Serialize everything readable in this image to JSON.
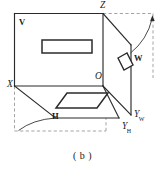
{
  "figure": {
    "caption": "( b )",
    "colors": {
      "stroke": "#2b2b2b",
      "dashed": "#8c8c8c",
      "background": "#ffffff",
      "text": "#1a1a1a"
    },
    "labels": {
      "v_plane": "V",
      "h_plane": "H",
      "w_plane": "W",
      "origin": "O",
      "axis_x": "X",
      "axis_z": "Z",
      "axis_y_w_base": "Y",
      "axis_y_w_sub": "W",
      "axis_y_h_base": "Y",
      "axis_y_h_sub": "H"
    },
    "shapes": {
      "v_projection": "rectangle",
      "h_projection": "parallelogram",
      "w_projection": "parallelogram"
    }
  }
}
